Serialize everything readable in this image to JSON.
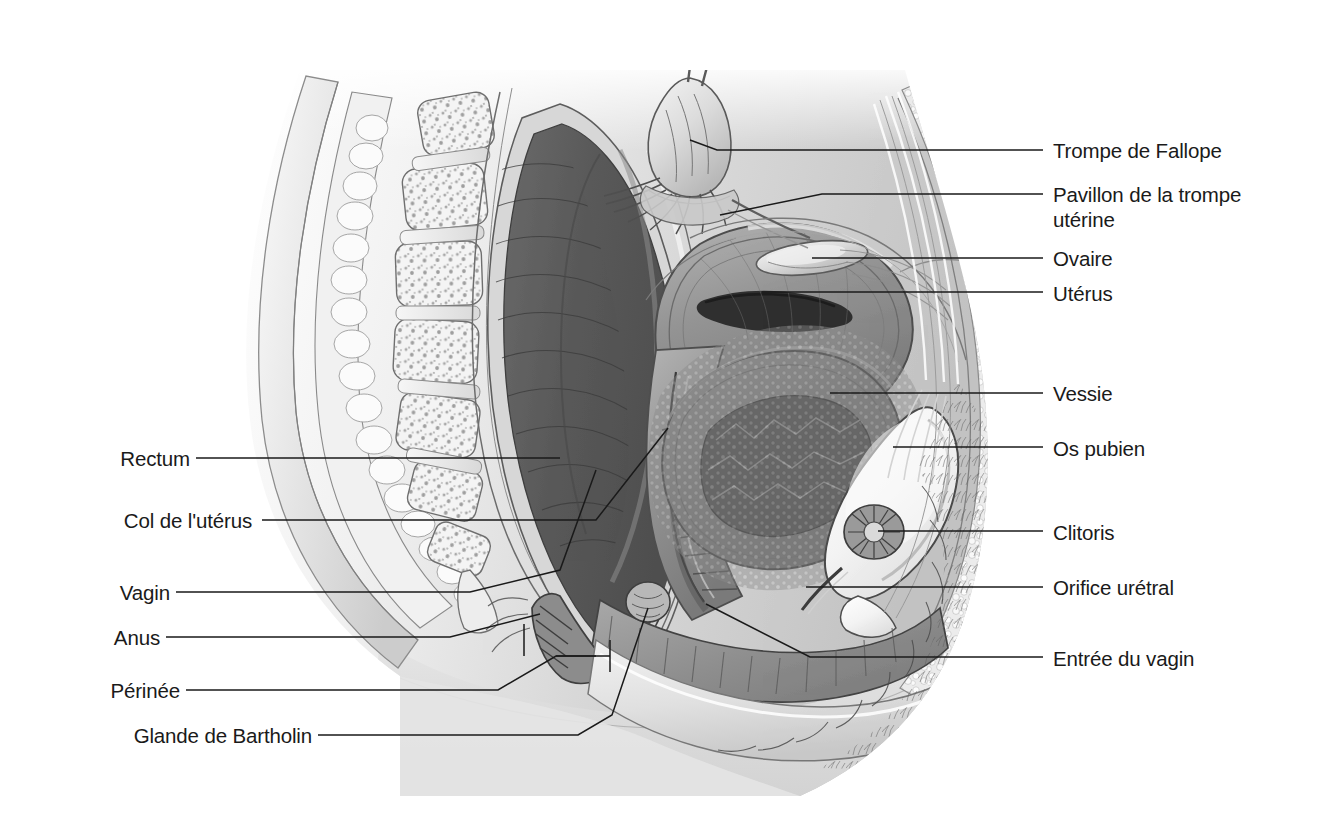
{
  "figure": {
    "letter": "a)",
    "title": "Vue sagittale",
    "style": "grayscale medical illustration",
    "background_color": "#ffffff",
    "text_color": "#1a1a1a",
    "leader_color": "#1a1a1a"
  },
  "labels_right": [
    {
      "id": "trompe-de-fallope",
      "text": "Trompe de Fallope",
      "x": 1053,
      "y": 138,
      "leader_x1": 1043,
      "leader_y1": 150,
      "leader_x2": 988,
      "leader_y2": 150,
      "target_x": 715,
      "target_y": 150
    },
    {
      "id": "pavillon-de-la-trompe-uterine",
      "text": "Pavillon de la trompe\nutérine",
      "x": 1053,
      "y": 182,
      "leader_x1": 1043,
      "leader_y1": 194,
      "leader_x2": 988,
      "leader_y2": 194,
      "target_x": 680,
      "target_y": 194
    },
    {
      "id": "ovaire",
      "text": "Ovaire",
      "x": 1053,
      "y": 246,
      "leader_x1": 1043,
      "leader_y1": 258,
      "leader_x2": 806,
      "leader_y2": 258,
      "target_x": 806,
      "target_y": 258
    },
    {
      "id": "uterus",
      "text": "Utérus",
      "x": 1053,
      "y": 281,
      "leader_x1": 1043,
      "leader_y1": 292,
      "leader_x2": 760,
      "leader_y2": 292,
      "target_x": 760,
      "target_y": 292
    },
    {
      "id": "vessie",
      "text": "Vessie",
      "x": 1053,
      "y": 381,
      "leader_x1": 1043,
      "leader_y1": 393,
      "leader_x2": 830,
      "leader_y2": 393,
      "target_x": 830,
      "target_y": 393
    },
    {
      "id": "os-pubien",
      "text": "Os pubien",
      "x": 1053,
      "y": 436,
      "leader_x1": 1043,
      "leader_y1": 447,
      "leader_x2": 892,
      "leader_y2": 447,
      "target_x": 892,
      "target_y": 447
    },
    {
      "id": "clitoris",
      "text": "Clitoris",
      "x": 1053,
      "y": 520,
      "leader_x1": 1043,
      "leader_y1": 531,
      "leader_x2": 878,
      "leader_y2": 531,
      "target_x": 878,
      "target_y": 531
    },
    {
      "id": "orifice-uretral",
      "text": "Orifice urétral",
      "x": 1053,
      "y": 575,
      "leader_x1": 1043,
      "leader_y1": 587,
      "leader_x2": 862,
      "leader_y2": 587,
      "target_x": 862,
      "target_y": 587
    },
    {
      "id": "entree-du-vagin",
      "text": "Entrée du vagin",
      "x": 1053,
      "y": 646,
      "leader_x1": 1043,
      "leader_y1": 657,
      "leader_x2": 806,
      "leader_y2": 657,
      "target_x": 806,
      "target_y": 657
    }
  ],
  "labels_left": [
    {
      "id": "rectum",
      "text": "Rectum",
      "x": 108,
      "y": 446,
      "leader_x1": 196,
      "leader_y1": 458,
      "leader_x2": 520,
      "leader_y2": 458
    },
    {
      "id": "col-de-luterus",
      "text": "Col de l'utérus",
      "x": 108,
      "y": 508,
      "leader_x1": 258,
      "leader_y1": 520,
      "leader_x2": 598,
      "leader_y2": 520
    },
    {
      "id": "vagin",
      "text": "Vagin",
      "x": 108,
      "y": 580,
      "leader_x1": 176,
      "leader_y1": 592,
      "leader_x2": 585,
      "leader_y2": 592
    },
    {
      "id": "anus",
      "text": "Anus",
      "x": 108,
      "y": 625,
      "leader_x1": 166,
      "leader_y1": 637,
      "leader_x2": 530,
      "leader_y2": 637
    },
    {
      "id": "perinee",
      "text": "Périnée",
      "x": 108,
      "y": 678,
      "leader_x1": 186,
      "leader_y1": 690,
      "leader_x2": 556,
      "leader_y2": 690
    },
    {
      "id": "glande-de-bartholin",
      "text": "Glande de Bartholin",
      "x": 108,
      "y": 723,
      "leader_x1": 318,
      "leader_y1": 735,
      "leader_x2": 578,
      "leader_y2": 735
    }
  ],
  "anatomy_parts": [
    "sacrum",
    "coccyx",
    "vertèbres",
    "rectum",
    "utérus",
    "ovaire",
    "trompe de Fallope",
    "pavillon",
    "vessie",
    "os pubien",
    "clitoris",
    "urètre",
    "vagin",
    "col de l'utérus",
    "anus",
    "périnée",
    "grandes lèvres"
  ]
}
